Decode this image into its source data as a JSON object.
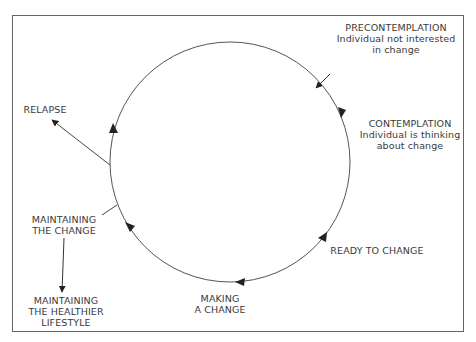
{
  "diagram": {
    "type": "cycle",
    "colors": {
      "line": "#555555",
      "text": "#3a3a3a",
      "border": "#666666",
      "background": "#ffffff"
    },
    "stages": [
      {
        "id": "precontemplation",
        "title": "PRECONTEMPLATION",
        "line2": "Individual not interested",
        "line3": "in change"
      },
      {
        "id": "contemplation",
        "title": "CONTEMPLATION",
        "line2": "Individual is thinking",
        "line3": "about change"
      },
      {
        "id": "ready",
        "title": "READY TO CHANGE"
      },
      {
        "id": "making",
        "line1": "MAKING",
        "line2": "A CHANGE"
      },
      {
        "id": "maintaining",
        "line1": "MAINTAINING",
        "line2": "THE CHANGE"
      },
      {
        "id": "relapse",
        "title": "RELAPSE"
      }
    ],
    "outcome": {
      "line1": "MAINTAINING",
      "line2": "THE HEALTHIER",
      "line3": "LIFESTYLE"
    }
  }
}
